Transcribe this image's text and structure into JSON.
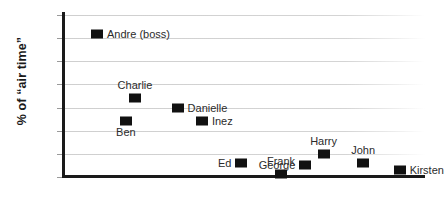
{
  "chart_data": {
    "type": "scatter",
    "title": "",
    "xlabel": "",
    "ylabel": "% of “air time”",
    "ylim": [
      0,
      35
    ],
    "ytick_labels": [
      "0",
      "5",
      "10",
      "15",
      "20",
      "25",
      "30",
      "35"
    ],
    "ytick_values": [
      0,
      5,
      10,
      15,
      20,
      25,
      30,
      35
    ],
    "xlim": [
      0,
      12
    ],
    "xtick_labels": [],
    "grid": "horizontal",
    "legend": "none",
    "marker_style": "filled-square",
    "marker_color": "#111111",
    "points": [
      {
        "label": "Andre (boss)",
        "x": 1.15,
        "y": 31,
        "label_pos": "right"
      },
      {
        "label": "Charlie",
        "x": 2.4,
        "y": 17,
        "label_pos": "above"
      },
      {
        "label": "Danielle",
        "x": 3.8,
        "y": 15,
        "label_pos": "right"
      },
      {
        "label": "Ben",
        "x": 2.1,
        "y": 12,
        "label_pos": "below"
      },
      {
        "label": "Inez",
        "x": 4.6,
        "y": 12,
        "label_pos": "right"
      },
      {
        "label": "Harry",
        "x": 8.6,
        "y": 5,
        "label_pos": "above"
      },
      {
        "label": "Ed",
        "x": 5.9,
        "y": 3,
        "label_pos": "left"
      },
      {
        "label": "John",
        "x": 9.9,
        "y": 3,
        "label_pos": "above"
      },
      {
        "label": "George",
        "x": 8.0,
        "y": 2.5,
        "label_pos": "left"
      },
      {
        "label": "Kirsten",
        "x": 11.1,
        "y": 1.5,
        "label_pos": "right"
      },
      {
        "label": "Frank",
        "x": 7.2,
        "y": 0.6,
        "label_pos": "above"
      }
    ]
  }
}
